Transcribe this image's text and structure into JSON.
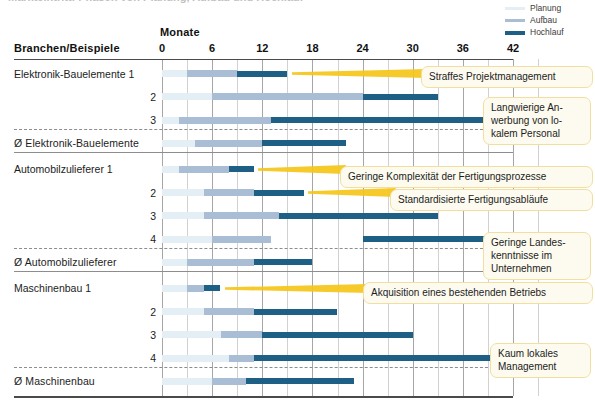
{
  "title": {
    "text": "Markteintritt: Phasen von Planung, Aufbau und Hochlauf"
  },
  "legend": {
    "position": "top-right",
    "items": [
      {
        "label": "Planung",
        "color": "#e4eef5"
      },
      {
        "label": "Aufbau",
        "color": "#a9bed4"
      },
      {
        "label": "Hochlauf",
        "color": "#1e5f85"
      }
    ]
  },
  "header": {
    "row_axis_title": "Monate",
    "row_label_title": "Branchen/Beispiele"
  },
  "chart_data": {
    "type": "bar",
    "subtype": "gantt-stacked-horizontal",
    "title": "Markteintritt: Phasen von Planung, Aufbau und Hochlauf",
    "xlabel": "Monate",
    "ylabel": "Branchen/Beispiele",
    "xlim": [
      0,
      45
    ],
    "xticks": [
      0,
      6,
      12,
      18,
      24,
      30,
      36,
      42
    ],
    "xtick_labels": [
      "0",
      "6",
      "12",
      "18",
      "24",
      "30",
      "36",
      "42"
    ],
    "grid": true,
    "grid_step_months": 3,
    "series": [
      {
        "name": "Planung",
        "color": "#e4eef5"
      },
      {
        "name": "Aufbau",
        "color": "#a9bed4"
      },
      {
        "name": "Hochlauf",
        "color": "#1e5f85"
      }
    ],
    "groups": [
      {
        "name": "Elektronik-Bauelemente",
        "rows": [
          {
            "label": "Elektronik-Bauelemente 1",
            "kind": "example",
            "phases": {
              "Planung": [
                0,
                3
              ],
              "Aufbau": [
                3,
                9
              ],
              "Hochlauf": [
                9,
                15
              ]
            }
          },
          {
            "label": "2",
            "kind": "example",
            "phases": {
              "Planung": [
                0,
                6
              ],
              "Aufbau": [
                6,
                24
              ],
              "Hochlauf": [
                24,
                33
              ]
            }
          },
          {
            "label": "3",
            "kind": "example",
            "phases": {
              "Planung": [
                0,
                2
              ],
              "Aufbau": [
                2,
                13
              ],
              "Hochlauf": [
                13,
                42
              ]
            }
          },
          {
            "label": "Ø Elektronik-Bauelemente",
            "kind": "average",
            "phases": {
              "Planung": [
                0,
                4
              ],
              "Aufbau": [
                4,
                12
              ],
              "Hochlauf": [
                12,
                22
              ]
            }
          }
        ]
      },
      {
        "name": "Automobilzulieferer",
        "rows": [
          {
            "label": "Automobilzulieferer 1",
            "kind": "example",
            "phases": {
              "Planung": [
                0,
                2
              ],
              "Aufbau": [
                2,
                8
              ],
              "Hochlauf": [
                8,
                11
              ]
            }
          },
          {
            "label": "2",
            "kind": "example",
            "phases": {
              "Planung": [
                0,
                5
              ],
              "Aufbau": [
                5,
                11
              ],
              "Hochlauf": [
                11,
                17
              ]
            }
          },
          {
            "label": "3",
            "kind": "example",
            "phases": {
              "Planung": [
                0,
                5
              ],
              "Aufbau": [
                5,
                14
              ],
              "Hochlauf": [
                14,
                33
              ]
            }
          },
          {
            "label": "4",
            "kind": "example",
            "phases": {
              "Planung": [
                0,
                6
              ],
              "Aufbau": [
                6,
                13
              ],
              "Hochlauf": [
                24,
                42
              ]
            }
          },
          {
            "label": "Ø Automobilzulieferer",
            "kind": "average",
            "phases": {
              "Planung": [
                0,
                3
              ],
              "Aufbau": [
                3,
                11
              ],
              "Hochlauf": [
                11,
                18
              ]
            }
          }
        ]
      },
      {
        "name": "Maschinenbau",
        "rows": [
          {
            "label": "Maschinenbau 1",
            "kind": "example",
            "phases": {
              "Planung": [
                0,
                3
              ],
              "Aufbau": [
                3,
                5
              ],
              "Hochlauf": [
                5,
                7
              ]
            }
          },
          {
            "label": "2",
            "kind": "example",
            "phases": {
              "Planung": [
                0,
                5
              ],
              "Aufbau": [
                5,
                11
              ],
              "Hochlauf": [
                11,
                21
              ]
            }
          },
          {
            "label": "3",
            "kind": "example",
            "phases": {
              "Planung": [
                0,
                7
              ],
              "Aufbau": [
                7,
                12
              ],
              "Hochlauf": [
                12,
                30
              ]
            }
          },
          {
            "label": "4",
            "kind": "example",
            "phases": {
              "Planung": [
                0,
                8
              ],
              "Aufbau": [
                8,
                11
              ],
              "Hochlauf": [
                11,
                40
              ]
            }
          },
          {
            "label": "Ø Maschinenbau",
            "kind": "average",
            "phases": {
              "Planung": [
                0,
                6
              ],
              "Aufbau": [
                6,
                10
              ],
              "Hochlauf": [
                10,
                23
              ]
            }
          }
        ]
      }
    ],
    "annotations": [
      {
        "text": "Straffes Projektmanagement",
        "target_row": "Elektronik-Bauelemente 1"
      },
      {
        "text": "Langwierige An-\nwerbung von lo-\nkalem Personal",
        "target_row": "Elektronik-Bauelemente 3"
      },
      {
        "text": "Geringe Komplexität der Fertigungsprozesse",
        "target_row": "Automobilzulieferer 1"
      },
      {
        "text": "Standardisierte Fertigungsabläufe",
        "target_row": "Automobilzulieferer 2"
      },
      {
        "text": "Geringe Landes-\nkenntnisse im\nUnternehmen",
        "target_row": "Automobilzulieferer 4"
      },
      {
        "text": "Akquisition eines bestehenden Betriebs",
        "target_row": "Maschinenbau 1"
      },
      {
        "text": "Kaum lokales\nManagement",
        "target_row": "Maschinenbau 4"
      }
    ]
  },
  "callouts": {
    "c1": "Straffes Projektmanagement",
    "c2_l1": "Langwierige An-",
    "c2_l2": "werbung von lo-",
    "c2_l3": "kalem Personal",
    "c3": "Geringe Komplexität der Fertigungsprozesse",
    "c4": "Standardisierte Fertigungsabläufe",
    "c5_l1": "Geringe Landes-",
    "c5_l2": "kenntnisse im",
    "c5_l3": "Unternehmen",
    "c6": "Akquisition eines bestehenden Betriebs",
    "c7_l1": "Kaum lokales",
    "c7_l2": "Management"
  },
  "colors": {
    "planung": "#e4eef5",
    "aufbau": "#a9bed4",
    "hochlauf": "#1e5f85",
    "callout_fill": "#fdfbef",
    "callout_border": "#f2dfa0",
    "pointer": "#f5c518"
  }
}
